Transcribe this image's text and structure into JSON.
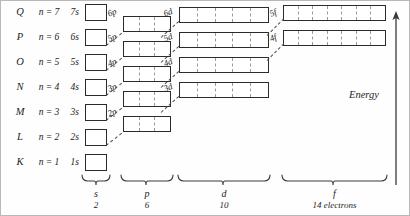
{
  "figure": {
    "energy_axis_label": "Energy",
    "shells": [
      {
        "letter": "Q",
        "n_label": "n = 7"
      },
      {
        "letter": "P",
        "n_label": "n = 6"
      },
      {
        "letter": "O",
        "n_label": "n = 5"
      },
      {
        "letter": "N",
        "n_label": "n = 4"
      },
      {
        "letter": "M",
        "n_label": "n = 3"
      },
      {
        "letter": "L",
        "n_label": "n = 2"
      },
      {
        "letter": "K",
        "n_label": "n = 1"
      }
    ],
    "s_orbitals": [
      {
        "label": "7s",
        "cells": 1
      },
      {
        "label": "6s",
        "cells": 1
      },
      {
        "label": "5s",
        "cells": 1
      },
      {
        "label": "4s",
        "cells": 1
      },
      {
        "label": "3s",
        "cells": 1
      },
      {
        "label": "2s",
        "cells": 1
      },
      {
        "label": "1s",
        "cells": 1
      }
    ],
    "p_orbitals": [
      {
        "label": "6p",
        "cells": 3
      },
      {
        "label": "5p",
        "cells": 3
      },
      {
        "label": "4p",
        "cells": 3
      },
      {
        "label": "3p",
        "cells": 3
      },
      {
        "label": "2p",
        "cells": 3
      }
    ],
    "d_orbitals": [
      {
        "label": "6d",
        "cells": 5
      },
      {
        "label": "5d",
        "cells": 5
      },
      {
        "label": "4d",
        "cells": 5
      },
      {
        "label": "3d",
        "cells": 5
      }
    ],
    "f_orbitals": [
      {
        "label": "5f",
        "cells": 7
      },
      {
        "label": "4f",
        "cells": 7
      }
    ],
    "subshell_groups": [
      {
        "symbol": "s",
        "capacity": "2"
      },
      {
        "symbol": "p",
        "capacity": "6"
      },
      {
        "symbol": "d",
        "capacity": "10"
      },
      {
        "symbol": "f",
        "capacity": "14 electrons"
      }
    ],
    "colors": {
      "box_stroke": "#2b2b2b",
      "cell_divider": "#9a9a9a",
      "connector": "#4a4a4a",
      "text": "#1d1d1d",
      "frame": "#b8b8b8",
      "background": "#fefefe"
    }
  }
}
